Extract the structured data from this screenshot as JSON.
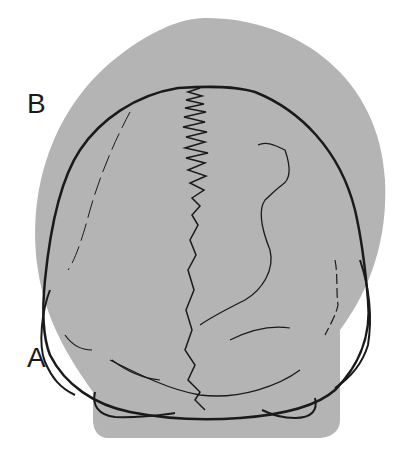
{
  "figure": {
    "labels": [
      {
        "id": "B",
        "text": "B",
        "x": 27,
        "y": 92
      },
      {
        "id": "A",
        "text": "A",
        "x": 27,
        "y": 346
      }
    ],
    "colors": {
      "background": "#ffffff",
      "shaded_region": "#b4b4b4",
      "outline": "#1a1a1a"
    }
  }
}
